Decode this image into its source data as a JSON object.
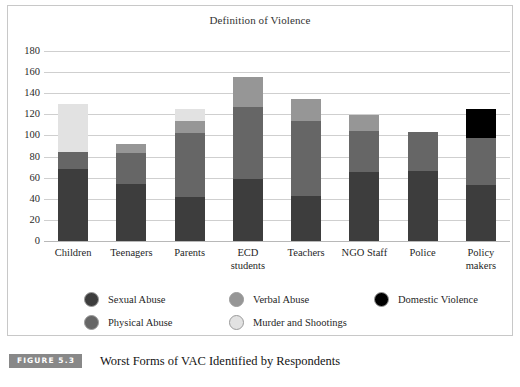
{
  "figure": {
    "badge": "FIGURE 5.3",
    "caption": "Worst Forms of VAC Identified by Respondents"
  },
  "chart_data": {
    "type": "bar",
    "stacked": true,
    "title": "Definition of Violence",
    "xlabel": "",
    "ylabel": "",
    "ylim": [
      0,
      180
    ],
    "yticks": [
      0,
      20,
      40,
      60,
      80,
      100,
      120,
      140,
      160,
      180
    ],
    "grid": true,
    "legend_position": "bottom",
    "categories": [
      "Children",
      "Teenagers",
      "Parents",
      "ECD students",
      "Teachers",
      "NGO Staff",
      "Police",
      "Policy makers"
    ],
    "category_lines": [
      [
        "Children"
      ],
      [
        "Teenagers"
      ],
      [
        "Parents"
      ],
      [
        "ECD",
        "students"
      ],
      [
        "Teachers"
      ],
      [
        "NGO Staff"
      ],
      [
        "Police"
      ],
      [
        "Policy",
        "makers"
      ]
    ],
    "series": [
      {
        "name": "Sexual Abuse",
        "color": "#3d3d3d",
        "values": [
          68,
          54,
          42,
          59,
          43,
          65,
          66,
          53
        ]
      },
      {
        "name": "Physical Abuse",
        "color": "#666666",
        "values": [
          16,
          29,
          60,
          68,
          71,
          39,
          37,
          45
        ]
      },
      {
        "name": "Verbal Abuse",
        "color": "#969696",
        "values": [
          0,
          9,
          12,
          28,
          21,
          15,
          0,
          0
        ]
      },
      {
        "name": "Murder and Shootings",
        "color": "#e2e2e2",
        "values": [
          46,
          0,
          11,
          0,
          0,
          0,
          0,
          0
        ]
      },
      {
        "name": "Domestic Violence",
        "color": "#000000",
        "values": [
          0,
          0,
          0,
          0,
          0,
          0,
          0,
          27
        ]
      }
    ],
    "totals": [
      130,
      92,
      125,
      155,
      135,
      119,
      103,
      125
    ]
  },
  "legend": {
    "entries": [
      {
        "label": "Sexual Abuse",
        "color": "#3d3d3d",
        "col": 0,
        "row": 0
      },
      {
        "label": "Physical Abuse",
        "color": "#666666",
        "col": 0,
        "row": 1
      },
      {
        "label": "Verbal Abuse",
        "color": "#969696",
        "col": 1,
        "row": 0
      },
      {
        "label": "Murder and Shootings",
        "color": "#e2e2e2",
        "col": 1,
        "row": 1
      },
      {
        "label": "Domestic Violence",
        "color": "#000000",
        "col": 2,
        "row": 0
      }
    ]
  }
}
